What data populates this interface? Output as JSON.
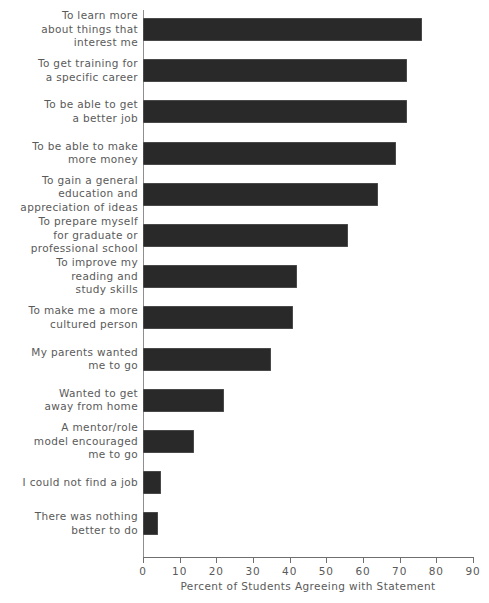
{
  "chart_data": {
    "type": "bar",
    "orientation": "horizontal",
    "title": "",
    "xlabel": "Percent of Students Agreeing with Statement",
    "ylabel": "",
    "xlim": [
      0,
      90
    ],
    "grid": false,
    "legend": null,
    "bar_color": "#292929",
    "text_color": "#5a5a5a",
    "xticks": [
      0,
      10,
      20,
      30,
      40,
      50,
      60,
      70,
      80,
      90
    ],
    "xtick_labels": [
      "0",
      "10",
      "20",
      "30",
      "40",
      "50",
      "60",
      "70",
      "80",
      "90"
    ],
    "categories": [
      "To learn more\nabout things that\ninterest me",
      "To get training for\na specific career",
      "To be able to get\na better job",
      "To be able to make\nmore money",
      "To gain a general\neducation and\nappreciation of ideas",
      "To prepare myself\nfor graduate or\nprofessional school",
      "To improve my\nreading and\nstudy skills",
      "To make me a more\ncultured person",
      "My parents wanted\nme to go",
      "Wanted to get\naway from home",
      "A mentor/role\nmodel encouraged\nme to go",
      "I could not find a job",
      "There was nothing\nbetter to do"
    ],
    "values": [
      76,
      72,
      72,
      69,
      64,
      56,
      42,
      41,
      35,
      22,
      14,
      5,
      4
    ]
  }
}
